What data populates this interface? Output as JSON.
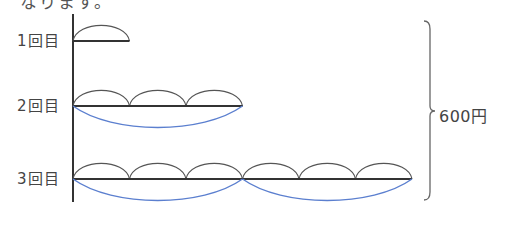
{
  "top_text": "なります。",
  "colors": {
    "line": "#333333",
    "arc": "#555555",
    "bracket_arc": "#5b7fcf",
    "brace": "#666666"
  },
  "axis": {
    "x": 73,
    "top": 14,
    "bottom": 202
  },
  "unit_width": 56.5,
  "rows": [
    {
      "label": "1回目",
      "y": 41,
      "units": 1,
      "groups": [],
      "label_top": 33
    },
    {
      "label": "2回目",
      "y": 106,
      "units": 3,
      "groups": [
        3
      ],
      "label_top": 98
    },
    {
      "label": "3回目",
      "y": 179,
      "units": 6,
      "groups": [
        3,
        3
      ],
      "label_top": 171
    }
  ],
  "arc_height": 16,
  "group_arc_depth": 22,
  "brace": {
    "x": 430,
    "top": 21,
    "bottom": 200,
    "mid": 111
  },
  "total": {
    "label": "600円"
  }
}
